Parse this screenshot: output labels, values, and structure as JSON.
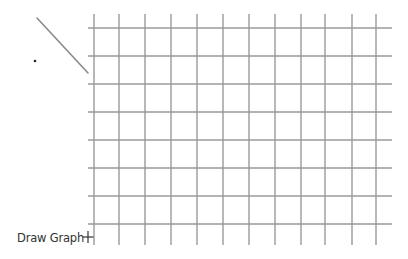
{
  "toolbar": {
    "draw_graph_label": "Draw Graph",
    "add_icon": "plus-icon"
  },
  "colors": {
    "background": "#ffffff",
    "grid_line": "#9a9a9a",
    "stroke": "#8a8a8a",
    "text": "#333333"
  },
  "grid": {
    "vertical_x": [
      94,
      119,
      145,
      171,
      197,
      223,
      249,
      275,
      301,
      325,
      352,
      376
    ],
    "vertical_y_range": [
      14,
      245
    ],
    "horizontal_y": [
      28,
      56,
      84,
      112,
      140,
      168,
      196,
      224
    ],
    "horizontal_x_range": [
      88,
      392
    ]
  },
  "drawing": {
    "line": {
      "x1": 37,
      "y1": 18,
      "x2": 88,
      "y2": 73
    },
    "dot": {
      "cx": 35,
      "cy": 61,
      "r": 1.3
    }
  }
}
